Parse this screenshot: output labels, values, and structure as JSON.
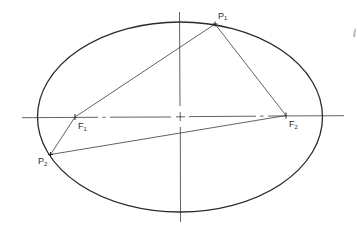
{
  "diagram": {
    "type": "ellipse-foci",
    "colors": {
      "stroke": "#2a2a2a",
      "thin_stroke": "#3a3a3a",
      "background": "#ffffff",
      "artifact": "#b5b5b5"
    },
    "ellipse": {
      "cx": 180,
      "cy": 117,
      "rx": 142.5,
      "ry": 95
    },
    "major_axis": {
      "x1": 22,
      "y1": 117.7,
      "x2": 344,
      "y2": 115.7
    },
    "minor_axis": {
      "x1": 179.5,
      "y1": 12,
      "x2": 180.5,
      "y2": 222
    },
    "points": {
      "F1": {
        "x": 75,
        "y": 117,
        "label": "F",
        "subscript": "1",
        "label_x": 78,
        "label_y": 129
      },
      "F2": {
        "x": 286,
        "y": 115.5,
        "label": "F",
        "subscript": "2",
        "label_x": 289,
        "label_y": 127
      },
      "P1": {
        "x": 215,
        "y": 24,
        "label": "P",
        "subscript": "1",
        "label_x": 218,
        "label_y": 19
      },
      "P2": {
        "x": 50.5,
        "y": 154.5,
        "label": "P",
        "subscript": "2",
        "label_x": 38,
        "label_y": 164
      }
    },
    "segments": [
      {
        "name": "P1-F1",
        "from": "P1",
        "to": "F1"
      },
      {
        "name": "P1-F2",
        "from": "P1",
        "to": "F2"
      },
      {
        "name": "P2-F1",
        "from": "P2",
        "to": "F1"
      },
      {
        "name": "P2-F2",
        "from": "P2",
        "to": "F2"
      }
    ],
    "labels": {
      "F1": "F",
      "F1_sub": "1",
      "F2": "F",
      "F2_sub": "2",
      "P1": "P",
      "P1_sub": "1",
      "P2": "P",
      "P2_sub": "2"
    }
  }
}
